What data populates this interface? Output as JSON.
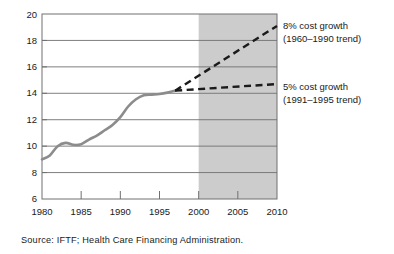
{
  "chart_data": {
    "type": "line",
    "title": "",
    "subtitle": "",
    "xlabel": "",
    "ylabel": "",
    "xlim": [
      1980,
      2010
    ],
    "ylim": [
      6,
      20
    ],
    "ytick_labels": [
      "6",
      "8",
      "10",
      "12",
      "14",
      "16",
      "18",
      "20"
    ],
    "ytick_values": [
      6,
      8,
      10,
      12,
      14,
      16,
      18,
      20
    ],
    "xtick_labels": [
      "1980",
      "1985",
      "1990",
      "1995",
      "2000",
      "2005",
      "2010"
    ],
    "xtick_values": [
      1980,
      1985,
      1990,
      1995,
      2000,
      2005,
      2010
    ],
    "grid": "horizontal",
    "legend_position": "right-inline-annotations",
    "shaded_region": {
      "label": "forecast",
      "x_start": 2000,
      "x_end": 2010,
      "color": "#cccccc"
    },
    "series": [
      {
        "name": "Historical",
        "style": "solid",
        "color": "#8c8c8c",
        "x": [
          1980,
          1981,
          1982,
          1983,
          1984,
          1985,
          1986,
          1987,
          1988,
          1989,
          1990,
          1991,
          1992,
          1993,
          1994,
          1995,
          1996,
          1997
        ],
        "values": [
          9.0,
          9.3,
          10.0,
          10.25,
          10.1,
          10.15,
          10.5,
          10.8,
          11.2,
          11.6,
          12.2,
          13.0,
          13.55,
          13.85,
          13.9,
          13.95,
          14.05,
          14.2
        ]
      },
      {
        "name": "8% cost growth",
        "style": "dashed",
        "color": "#1a1a1a",
        "x": [
          1997,
          2010
        ],
        "values": [
          14.2,
          19.1
        ]
      },
      {
        "name": "5% cost growth",
        "style": "dashed",
        "color": "#1a1a1a",
        "x": [
          1997,
          2010
        ],
        "values": [
          14.2,
          14.7
        ]
      }
    ],
    "annotations": [
      {
        "name": "eight-percent",
        "line1": "8% cost growth",
        "line2": "(1960–1990 trend)"
      },
      {
        "name": "five-percent",
        "line1": "5% cost growth",
        "line2": "(1991–1995 trend)"
      }
    ]
  },
  "source": {
    "text": "Source: IFTF; Health Care Financing Administration."
  }
}
